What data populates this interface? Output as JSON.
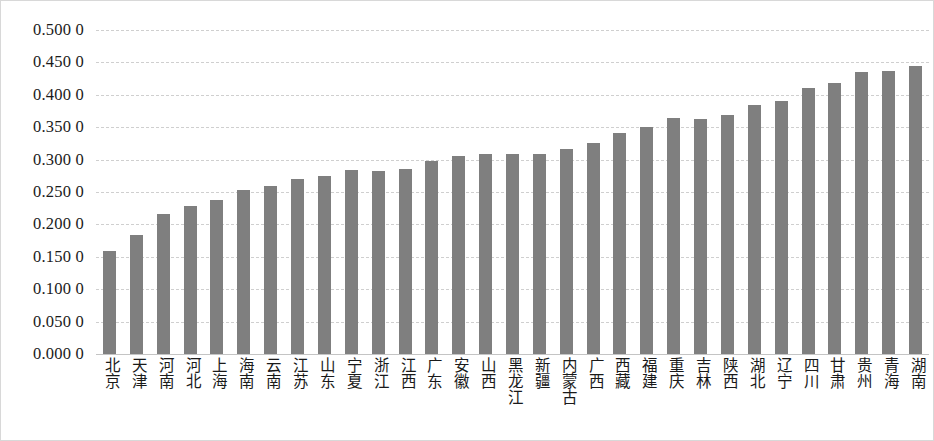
{
  "chart_data": {
    "type": "bar",
    "title": "",
    "subtitle": "",
    "xlabel": "",
    "ylabel": "",
    "orientation": "vertical",
    "grid": true,
    "legend": false,
    "legend_position": "none",
    "bar_color": "#7f7f7f",
    "gridline_color": "#cfcfcf",
    "axis_text_color": "#1a1a1a",
    "ylim": [
      0.0,
      0.5
    ],
    "ytick_step": 0.05,
    "ytick_labels": [
      "0.500 0",
      "0.450 0",
      "0.400 0",
      "0.350 0",
      "0.300 0",
      "0.250 0",
      "0.200 0",
      "0.150 0",
      "0.100 0",
      "0.050 0",
      "0.000 0"
    ],
    "ytick_values": [
      0.5,
      0.45,
      0.4,
      0.35,
      0.3,
      0.25,
      0.2,
      0.15,
      0.1,
      0.05,
      0.0
    ],
    "categories": [
      "北京",
      "天津",
      "河南",
      "河北",
      "上海",
      "海南",
      "云南",
      "江苏",
      "山东",
      "宁夏",
      "浙江",
      "江西",
      "广东",
      "安徽",
      "山西",
      "黑龙江",
      "新疆",
      "内蒙古",
      "广西",
      "西藏",
      "福建",
      "重庆",
      "吉林",
      "陕西",
      "湖北",
      "辽宁",
      "四川",
      "甘肃",
      "贵州",
      "青海",
      "湖南"
    ],
    "values": [
      0.159,
      0.183,
      0.216,
      0.228,
      0.237,
      0.253,
      0.259,
      0.27,
      0.274,
      0.284,
      0.283,
      0.286,
      0.298,
      0.306,
      0.308,
      0.308,
      0.308,
      0.316,
      0.325,
      0.341,
      0.351,
      0.364,
      0.363,
      0.369,
      0.384,
      0.391,
      0.41,
      0.419,
      0.435,
      0.437,
      0.444
    ]
  }
}
